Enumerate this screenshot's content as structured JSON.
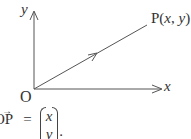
{
  "diagram": {
    "type": "vector-coordinate-diagram",
    "colors": {
      "line": "#555555",
      "text": "#333333",
      "background": "#ffffff"
    },
    "axes": {
      "x_label": "x",
      "y_label": "y",
      "origin_label": "O"
    },
    "point": {
      "name": "P",
      "label": "P(x, y)",
      "label_prefix": "P(",
      "coord_x": "x",
      "separator": ", ",
      "coord_y": "y",
      "label_suffix": ")"
    },
    "equation": {
      "lhs": "OP",
      "lhs_arrow": "→",
      "equals": "=",
      "column_vector": [
        "x",
        "y"
      ],
      "terminator": "."
    }
  }
}
